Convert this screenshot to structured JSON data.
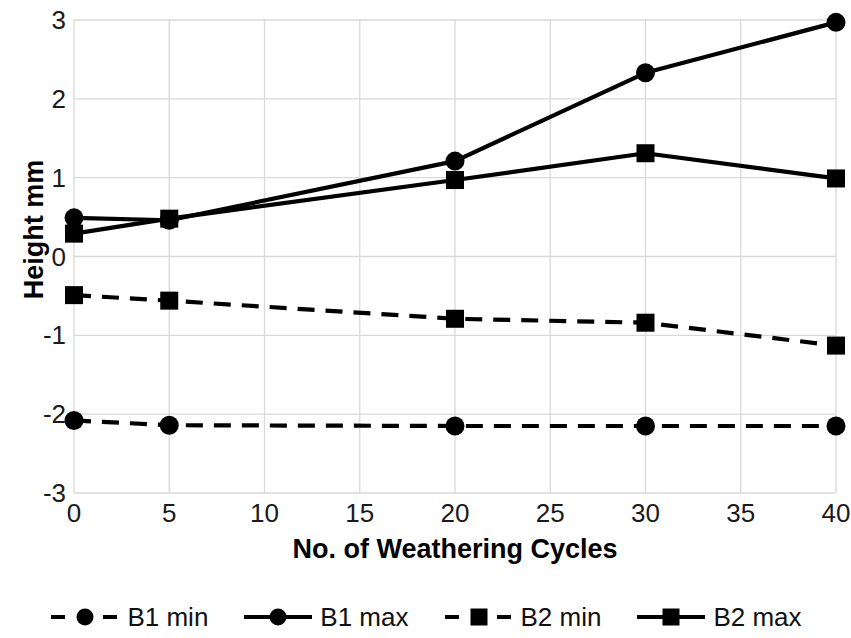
{
  "chart_data": {
    "type": "line",
    "title": "",
    "xlabel": "No. of Weathering Cycles",
    "ylabel": "Height mm",
    "x": [
      0,
      5,
      20,
      30,
      40
    ],
    "xlim": [
      0,
      40
    ],
    "ylim": [
      -3,
      3
    ],
    "xticks": [
      "0",
      "5",
      "10",
      "15",
      "20",
      "25",
      "30",
      "35",
      "40"
    ],
    "xtick_values": [
      0,
      5,
      10,
      15,
      20,
      25,
      30,
      35,
      40
    ],
    "yticks": [
      "3",
      "2",
      "1",
      "0",
      "-1",
      "-2",
      "-3"
    ],
    "ytick_values": [
      3,
      2,
      1,
      0,
      -1,
      -2,
      -3
    ],
    "grid": true,
    "legend_position": "bottom",
    "series": [
      {
        "name": "B1 min",
        "marker": "circle",
        "linestyle": "dashed",
        "color": "#000000",
        "values": [
          -2.08,
          -2.14,
          -2.15,
          -2.15,
          -2.15
        ]
      },
      {
        "name": "B1 max",
        "marker": "circle",
        "linestyle": "solid",
        "color": "#000000",
        "values": [
          0.49,
          0.46,
          1.21,
          2.33,
          2.97
        ]
      },
      {
        "name": "B2 min",
        "marker": "square",
        "linestyle": "dashed",
        "color": "#000000",
        "values": [
          -0.49,
          -0.56,
          -0.79,
          -0.84,
          -1.13
        ]
      },
      {
        "name": "B2 max",
        "marker": "square",
        "linestyle": "solid",
        "color": "#000000",
        "values": [
          0.29,
          0.48,
          0.97,
          1.31,
          0.99
        ]
      }
    ]
  },
  "axes": {
    "y_title": "Height mm",
    "x_title": "No. of Weathering Cycles"
  },
  "legend": {
    "items": [
      {
        "label": "B1 min",
        "marker": "circle",
        "linestyle": "dashed"
      },
      {
        "label": "B1 max",
        "marker": "circle",
        "linestyle": "solid"
      },
      {
        "label": "B2 min",
        "marker": "square",
        "linestyle": "dashed"
      },
      {
        "label": "B2 max",
        "marker": "square",
        "linestyle": "solid"
      }
    ]
  },
  "colors": {
    "series": "#000000",
    "grid": "#d9d9d9",
    "text": "#000000",
    "background": "#ffffff"
  }
}
